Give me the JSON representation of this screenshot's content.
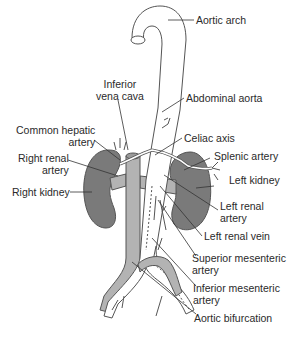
{
  "diagram": {
    "colors": {
      "background": "#ffffff",
      "outline": "#555555",
      "kidney_fill": "#7a7a7a",
      "vein_fill": "#b3b3b3",
      "artery_fill": "#ffffff",
      "text": "#2a2a2a"
    },
    "labels": {
      "aortic_arch": "Aortic arch",
      "abdominal_aorta": "Abdominal aorta",
      "inferior_vena_cava": [
        "Inferior",
        "vena cava"
      ],
      "common_hepatic_artery": [
        "Common hepatic",
        "artery"
      ],
      "celiac_axis": "Celiac axis",
      "splenic_artery": "Splenic artery",
      "right_renal_artery": [
        "Right renal",
        "artery"
      ],
      "right_kidney": "Right kidney",
      "left_kidney": "Left kidney",
      "left_renal_artery": [
        "Left renal",
        "artery"
      ],
      "left_renal_vein": "Left renal vein",
      "superior_mesenteric_artery": [
        "Superior mesenteric",
        "artery"
      ],
      "inferior_mesenteric_artery": [
        "Inferior mesenteric",
        "artery"
      ],
      "aortic_bifurcation": "Aortic bifurcation"
    }
  }
}
